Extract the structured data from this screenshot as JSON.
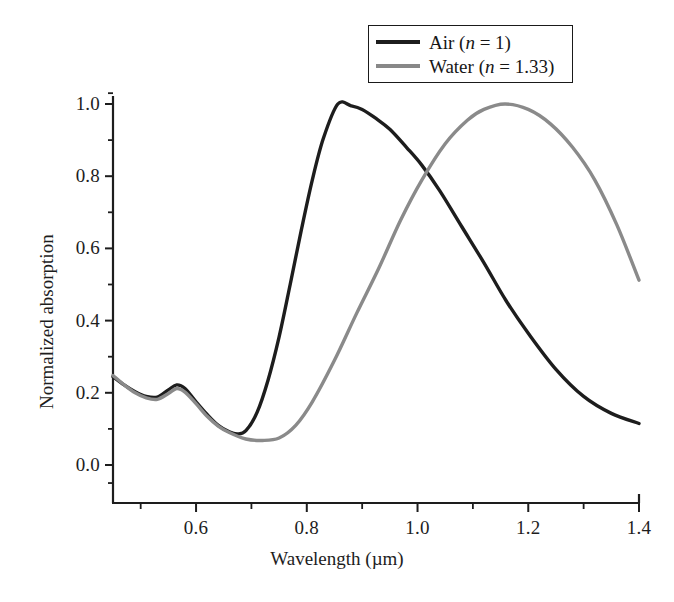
{
  "chart_data": {
    "type": "line",
    "title": "",
    "xlabel": "Wavelength (µm)",
    "ylabel": "Normalized absorption",
    "xlim": [
      0.45,
      1.4
    ],
    "ylim": [
      -0.105,
      1.055
    ],
    "grid": false,
    "legend_position": "top-right",
    "xticks": [
      "0.6",
      "0.8",
      "1.0",
      "1.2",
      "1.4"
    ],
    "xtick_values": [
      0.6,
      0.8,
      1.0,
      1.2,
      1.4
    ],
    "xminor_step": 0.1,
    "yticks": [
      "0.0",
      "0.2",
      "0.4",
      "0.6",
      "0.8",
      "1.0"
    ],
    "ytick_values": [
      0.0,
      0.2,
      0.4,
      0.6,
      0.8,
      1.0
    ],
    "yminor_step": 0.1,
    "series": [
      {
        "name": "Air (n = 1)",
        "legend_label_prefix": "Air (",
        "legend_label_var": "n",
        "legend_label_suffix": " = 1)",
        "color": "#1d1d1d",
        "width": 3.4,
        "x": [
          0.45,
          0.47,
          0.49,
          0.51,
          0.53,
          0.55,
          0.565,
          0.58,
          0.6,
          0.62,
          0.64,
          0.66,
          0.675,
          0.69,
          0.71,
          0.73,
          0.75,
          0.77,
          0.79,
          0.81,
          0.83,
          0.856,
          0.88,
          0.9,
          0.925,
          0.95,
          0.98,
          1.008,
          1.04,
          1.08,
          1.12,
          1.16,
          1.2,
          1.25,
          1.3,
          1.35,
          1.4
        ],
        "y": [
          0.245,
          0.222,
          0.203,
          0.19,
          0.188,
          0.208,
          0.222,
          0.212,
          0.175,
          0.14,
          0.11,
          0.092,
          0.086,
          0.095,
          0.145,
          0.235,
          0.355,
          0.5,
          0.65,
          0.79,
          0.905,
          1.0,
          0.995,
          0.985,
          0.96,
          0.93,
          0.88,
          0.83,
          0.76,
          0.66,
          0.56,
          0.455,
          0.365,
          0.265,
          0.19,
          0.143,
          0.115
        ]
      },
      {
        "name": "Water (n = 1.33)",
        "legend_label_prefix": "Water (",
        "legend_label_var": "n",
        "legend_label_suffix": " = 1.33)",
        "color": "#8a8a8a",
        "width": 3.4,
        "x": [
          0.45,
          0.47,
          0.49,
          0.51,
          0.53,
          0.55,
          0.565,
          0.58,
          0.6,
          0.62,
          0.64,
          0.66,
          0.69,
          0.72,
          0.75,
          0.78,
          0.81,
          0.85,
          0.89,
          0.93,
          0.97,
          1.008,
          1.05,
          1.09,
          1.12,
          1.158,
          1.2,
          1.24,
          1.28,
          1.32,
          1.36,
          1.4
        ],
        "y": [
          0.248,
          0.222,
          0.2,
          0.186,
          0.182,
          0.198,
          0.212,
          0.202,
          0.17,
          0.135,
          0.108,
          0.09,
          0.072,
          0.068,
          0.075,
          0.11,
          0.175,
          0.29,
          0.42,
          0.545,
          0.68,
          0.79,
          0.89,
          0.955,
          0.985,
          1.0,
          0.985,
          0.945,
          0.88,
          0.79,
          0.665,
          0.512
        ]
      }
    ],
    "annotations": {
      "crossing_point": {
        "x": 1.008,
        "y": 0.83
      },
      "air_peak": {
        "x": 0.856,
        "y": 1.0
      },
      "water_peak": {
        "x": 1.158,
        "y": 1.0
      }
    }
  },
  "legend": {
    "rows": [
      {
        "label": "Air (n = 1)",
        "color": "#1d1d1d"
      },
      {
        "label": "Water (n = 1.33)",
        "color": "#8a8a8a"
      }
    ]
  },
  "axes": {
    "x_title": "Wavelength (µm)",
    "y_title": "Normalized absorption",
    "x_labels": [
      "0.6",
      "0.8",
      "1.0",
      "1.2",
      "1.4"
    ],
    "y_labels": [
      "0.0",
      "0.2",
      "0.4",
      "0.6",
      "0.8",
      "1.0"
    ]
  }
}
